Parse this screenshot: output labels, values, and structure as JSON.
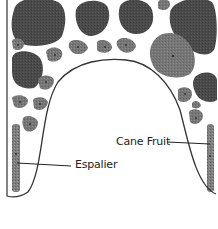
{
  "diagram": {
    "type": "garden-plan",
    "colors": {
      "tree": "#4a4a4a",
      "shrub": "#7a7a7a",
      "large_shrub": "#8a8a8a",
      "strip": "#7e7e7e",
      "outline": "#333333",
      "background": "#ffffff"
    },
    "labels": {
      "espalier": "Espalier",
      "cane_fruit": "Cane Fruit"
    },
    "trees": [
      {
        "cx": 38,
        "cy": 22,
        "rx": 26,
        "ry": 24
      },
      {
        "cx": 92,
        "cy": 17,
        "rx": 16,
        "ry": 18
      },
      {
        "cx": 136,
        "cy": 16,
        "rx": 17,
        "ry": 18
      },
      {
        "cx": 192,
        "cy": 25,
        "rx": 24,
        "ry": 26
      },
      {
        "cx": 24,
        "cy": 70,
        "rx": 14,
        "ry": 17
      },
      {
        "cx": 205,
        "cy": 88,
        "rx": 12,
        "ry": 14
      }
    ],
    "shrubs": [
      {
        "cx": 18,
        "cy": 45,
        "r": 7
      },
      {
        "cx": 55,
        "cy": 55,
        "r": 9
      },
      {
        "cx": 78,
        "cy": 47,
        "r": 9
      },
      {
        "cx": 105,
        "cy": 47,
        "r": 8
      },
      {
        "cx": 126,
        "cy": 45,
        "r": 9
      },
      {
        "cx": 164,
        "cy": 5,
        "r": 7
      },
      {
        "cx": 46,
        "cy": 82,
        "r": 8
      },
      {
        "cx": 20,
        "cy": 102,
        "r": 8
      },
      {
        "cx": 40,
        "cy": 104,
        "r": 8
      },
      {
        "cx": 30,
        "cy": 124,
        "r": 8
      },
      {
        "cx": 185,
        "cy": 94,
        "r": 8
      },
      {
        "cx": 196,
        "cy": 118,
        "r": 8
      },
      {
        "cx": 196,
        "cy": 106,
        "r": 6
      }
    ],
    "large_shrubs": [
      {
        "cx": 172,
        "cy": 55,
        "rx": 21,
        "ry": 22
      }
    ]
  }
}
